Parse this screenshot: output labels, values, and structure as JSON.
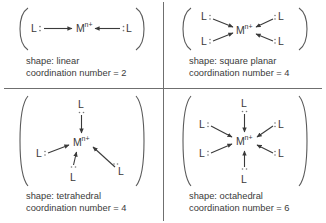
{
  "figure": {
    "background_color": "#ffffff",
    "line_color": "#3a3a3a",
    "divider_color": "#6f6f6f",
    "metal_label": "M",
    "metal_charge": "n+",
    "ligand_label": "L",
    "lone_pair_symbol": "··"
  },
  "panels": [
    {
      "id": "linear",
      "position": "top-left",
      "shape_line": "shape: linear",
      "coordination_line": "coordination number = 2",
      "shape_value": "linear",
      "coordination_number": 2,
      "ligand_count": 2,
      "ligand_positions": [
        "left",
        "right"
      ]
    },
    {
      "id": "square-planar",
      "position": "top-right",
      "shape_line": "shape: square planar",
      "coordination_line": "coordination number = 4",
      "shape_value": "square planar",
      "coordination_number": 4,
      "ligand_count": 4,
      "ligand_positions": [
        "upper-left",
        "lower-left",
        "upper-right",
        "lower-right"
      ]
    },
    {
      "id": "tetrahedral",
      "position": "bottom-left",
      "shape_line": "shape: tetrahedral",
      "coordination_line": "coordination number = 4",
      "shape_value": "tetrahedral",
      "coordination_number": 4,
      "ligand_count": 4,
      "ligand_positions": [
        "top",
        "left",
        "bottom",
        "lower-right"
      ]
    },
    {
      "id": "octahedral",
      "position": "bottom-right",
      "shape_line": "shape: octahedral",
      "coordination_line": "coordination number = 6",
      "shape_value": "octahedral",
      "coordination_number": 6,
      "ligand_count": 6,
      "ligand_positions": [
        "top",
        "bottom",
        "upper-left",
        "lower-left",
        "upper-right",
        "lower-right"
      ]
    }
  ]
}
